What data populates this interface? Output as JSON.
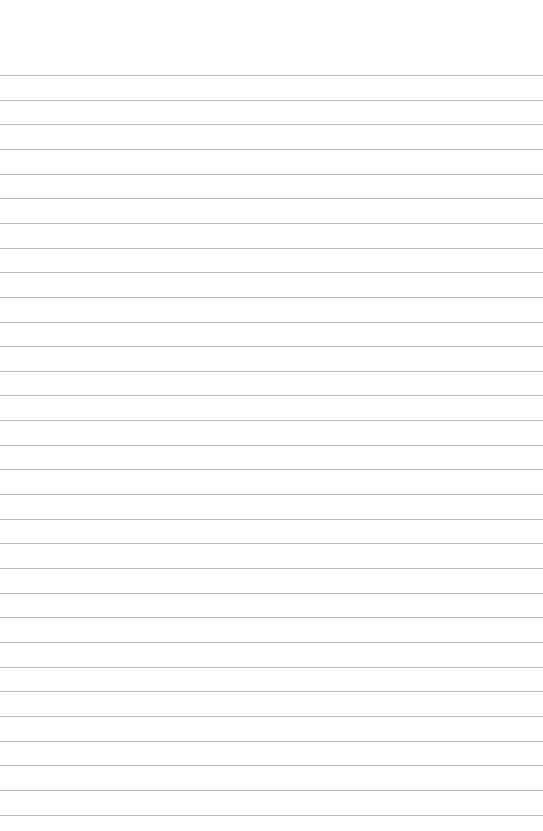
{
  "page": {
    "type": "blank-lined-paper",
    "line_count": 31,
    "first_line_y": 75,
    "line_spacing": 24.65,
    "line_color": "#b8b8b8",
    "background_color": "#ffffff"
  }
}
